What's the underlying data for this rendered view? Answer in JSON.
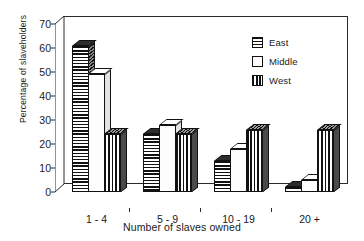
{
  "chart_data": {
    "type": "bar",
    "title": "",
    "xlabel": "Number of slaves owned",
    "ylabel": "Percentage of slaveholders",
    "categories": [
      "1 - 4",
      "5 - 9",
      "10 - 19",
      "20 +"
    ],
    "series": [
      {
        "name": "East",
        "pattern": "horizontal-stripes",
        "values": [
          61,
          24,
          13,
          2
        ]
      },
      {
        "name": "Middle",
        "pattern": "solid-white",
        "values": [
          49,
          28,
          18,
          5
        ]
      },
      {
        "name": "West",
        "pattern": "vertical-stripes",
        "values": [
          24,
          24,
          26,
          26
        ]
      }
    ],
    "yticks": [
      0,
      10,
      20,
      30,
      40,
      50,
      60,
      70
    ],
    "ylim": [
      0,
      70
    ],
    "grid": false,
    "legend_position": "top-right",
    "style": "3d-column"
  },
  "legend": {
    "items": [
      {
        "label": "East",
        "swatch": "hstripe"
      },
      {
        "label": "Middle",
        "swatch": "solidwhite"
      },
      {
        "label": "West",
        "swatch": "vstripe"
      }
    ]
  },
  "colors": {
    "outline": "#111111",
    "background": "#ffffff",
    "axis": "#2b2b2b"
  }
}
